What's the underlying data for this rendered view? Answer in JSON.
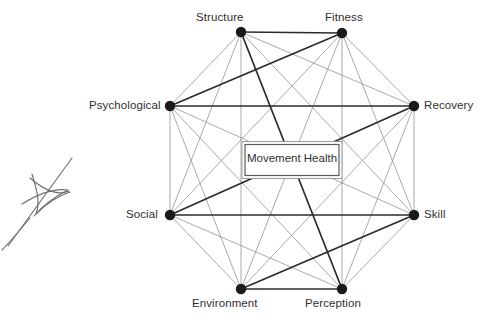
{
  "diagram": {
    "title": "Movement Health",
    "type": "octagon-network",
    "center": {
      "label": "Movement Health",
      "x": 292,
      "y": 160,
      "box_width": 94,
      "box_height": 31
    },
    "geometry": {
      "center_x": 292,
      "center_y": 160.5,
      "radius": 130,
      "node_count": 8,
      "edges_total": 28,
      "perimeter_edges": 8,
      "interior_chords": 20
    },
    "colors": {
      "perimeter_edge": "#2b2b2b",
      "interior_chord": "#8d8d8d",
      "node_fill": "#1a1a1a",
      "label_text": "#2f2f2f",
      "center_box_border": "#5a5a5a",
      "background": "#ffffff",
      "scribble": "#6f6f72"
    },
    "nodes": [
      {
        "id": "structure",
        "label": "Structure",
        "x": 241,
        "y": 32,
        "label_x": 196,
        "label_y": 11,
        "anchor": "above-left"
      },
      {
        "id": "fitness",
        "label": "Fitness",
        "x": 342,
        "y": 33,
        "label_x": 325,
        "label_y": 11,
        "anchor": "above-right"
      },
      {
        "id": "psychological",
        "label": "Psychological",
        "x": 170,
        "y": 106,
        "label_x": 89,
        "label_y": 99,
        "anchor": "left"
      },
      {
        "id": "recovery",
        "label": "Recovery",
        "x": 414,
        "y": 106,
        "label_x": 424,
        "label_y": 99,
        "anchor": "right"
      },
      {
        "id": "social",
        "label": "Social",
        "x": 170,
        "y": 215,
        "label_x": 126,
        "label_y": 208,
        "anchor": "left"
      },
      {
        "id": "skill",
        "label": "Skill",
        "x": 414,
        "y": 215,
        "label_x": 424,
        "label_y": 208,
        "anchor": "right"
      },
      {
        "id": "environment",
        "label": "Environment",
        "x": 241,
        "y": 289,
        "label_x": 192,
        "label_y": 297,
        "anchor": "below-left"
      },
      {
        "id": "perception",
        "label": "Perception",
        "x": 342,
        "y": 289,
        "label_x": 305,
        "label_y": 297,
        "anchor": "below-right"
      }
    ],
    "node_radius": 5.2
  },
  "annotation": {
    "scribble_name": "pen-scribble-artifact",
    "description": "handwritten ink scribble in left margin"
  }
}
